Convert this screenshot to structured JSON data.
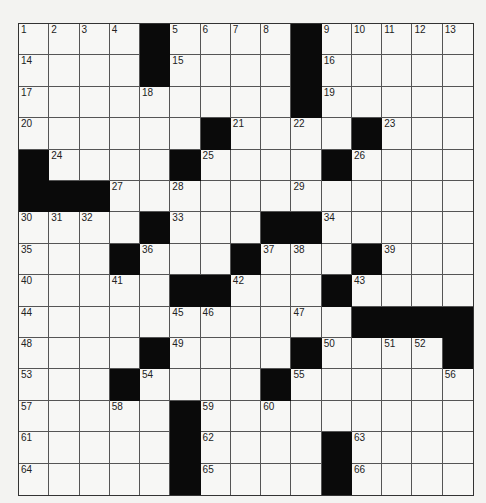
{
  "puzzle": {
    "rows": 15,
    "cols": 15,
    "grid": [
      [
        "1",
        "2",
        "3",
        "4",
        "#",
        "5",
        "6",
        "7",
        "8",
        "#",
        "9",
        "10",
        "11",
        "12",
        "13"
      ],
      [
        "14",
        "",
        "",
        "",
        "#",
        "15",
        "",
        "",
        "",
        "#",
        "16",
        "",
        "",
        "",
        ""
      ],
      [
        "17",
        "",
        "",
        "",
        "18",
        "",
        "",
        "",
        "",
        "#",
        "19",
        "",
        "",
        "",
        ""
      ],
      [
        "20",
        "",
        "",
        "",
        "",
        "",
        "#",
        "21",
        "",
        "22",
        "",
        "#",
        "23",
        "",
        ""
      ],
      [
        "#",
        "24",
        "",
        "",
        "",
        "#",
        "25",
        "",
        "",
        "",
        "#",
        "26",
        "",
        "",
        ""
      ],
      [
        "#",
        "#",
        "#",
        "27",
        "",
        "28",
        "",
        "",
        "",
        "29",
        "",
        "",
        "",
        "",
        ""
      ],
      [
        "30",
        "31",
        "32",
        "",
        "#",
        "33",
        "",
        "",
        "#",
        "#",
        "34",
        "",
        "",
        "",
        ""
      ],
      [
        "35",
        "",
        "",
        "#",
        "36",
        "",
        "",
        "#",
        "37",
        "38",
        "",
        "#",
        "39",
        "",
        ""
      ],
      [
        "40",
        "",
        "",
        "41",
        "",
        "#",
        "#",
        "42",
        "",
        "",
        "#",
        "43",
        "",
        "",
        ""
      ],
      [
        "44",
        "",
        "",
        "",
        "",
        "45",
        "46",
        "",
        "",
        "47",
        "",
        "#",
        "#",
        "#",
        "#"
      ],
      [
        "48",
        "",
        "",
        "",
        "#",
        "49",
        "",
        "",
        "",
        "#",
        "50",
        "",
        "51",
        "52",
        "#"
      ],
      [
        "53",
        "",
        "",
        "#",
        "54",
        "",
        "",
        "",
        "#",
        "55",
        "",
        "",
        "",
        "",
        "56"
      ],
      [
        "57",
        "",
        "",
        "58",
        "",
        "#",
        "59",
        "",
        "60",
        "",
        "",
        "",
        "",
        "",
        ""
      ],
      [
        "61",
        "",
        "",
        "",
        "",
        "#",
        "62",
        "",
        "",
        "",
        "#",
        "63",
        "",
        "",
        ""
      ],
      [
        "64",
        "",
        "",
        "",
        "",
        "#",
        "65",
        "",
        "",
        "",
        "#",
        "66",
        "",
        "",
        ""
      ]
    ]
  }
}
